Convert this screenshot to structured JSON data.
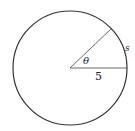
{
  "diagram": {
    "type": "circle-sector",
    "labels": {
      "angle": "θ",
      "radius": "5",
      "arc": "s"
    },
    "colors": {
      "stroke": "#333333",
      "background": "#ffffff"
    }
  }
}
